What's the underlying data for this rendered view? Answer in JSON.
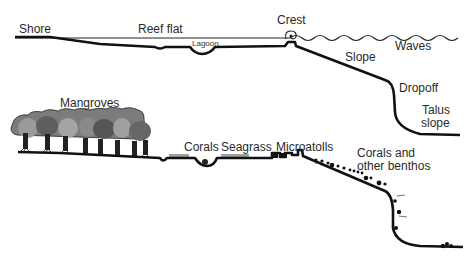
{
  "top_panel": {
    "title": "Reef profile (upper)",
    "labels": {
      "shore": "Shore",
      "reef_flat": "Reef flat",
      "lagoon": "Lagoon",
      "crest": "Crest",
      "waves": "Waves",
      "slope": "Slope",
      "dropoff": "Dropoff",
      "talus_line1": "Talus",
      "talus_line2": "slope"
    }
  },
  "bottom_panel": {
    "title": "Reef profile with biota (lower)",
    "labels": {
      "mangroves": "Mangroves",
      "corals": "Corals",
      "seagrass": "Seagrass",
      "microatolls": "Microatolls",
      "benthos_line1": "Corals and",
      "benthos_line2": "other benthos"
    }
  },
  "colors": {
    "line": "#111111",
    "text": "#2a2a2a",
    "background": "#ffffff"
  }
}
